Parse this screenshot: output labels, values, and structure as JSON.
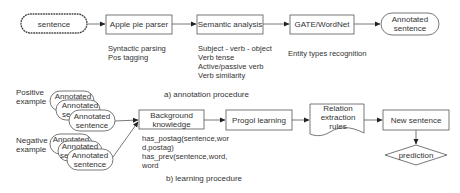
{
  "annotation": {
    "input": "sentence",
    "parser": {
      "label": "Apple pie parser",
      "notes": [
        "Syntactic parsing",
        "Pos tagging"
      ]
    },
    "semantic": {
      "label": "Semantic analysis",
      "notes": [
        "Subject - verb - object",
        "Verb tense",
        "Active/passive verb",
        "Verb similarity"
      ]
    },
    "gate": {
      "label": "GATE/WordNet",
      "notes": [
        "Entity types recognition"
      ]
    },
    "output": [
      "Annotated",
      "sentence"
    ],
    "caption": "a) annotation procedure"
  },
  "learning": {
    "positive_label": [
      "Positive",
      "example"
    ],
    "negative_label": [
      "Negative",
      "example"
    ],
    "stack_item_line1": "Annotated",
    "stack_item_line2": "sentence",
    "stack_partial": "se",
    "background": {
      "label": [
        "Background",
        "knowledge"
      ],
      "notes": [
        "has_postag(sentence,wor",
        "d,postag)",
        "has_prev(sentence,word,",
        "word"
      ]
    },
    "progol": "Progol learning",
    "rules": [
      "Relation",
      "extraction",
      "rules"
    ],
    "new_sentence": "New sentence",
    "prediction": "prediction",
    "caption": "b)  learning procedure"
  }
}
